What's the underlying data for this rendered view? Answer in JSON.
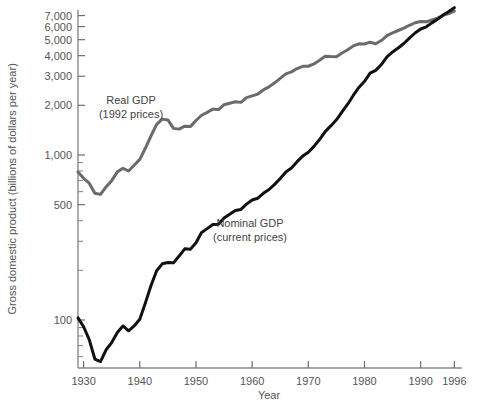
{
  "chart_data": {
    "type": "line",
    "title": "",
    "xlabel": "Year",
    "ylabel": "Gross domestic product (billions of dollars per year)",
    "yscale": "log",
    "ylim": [
      40,
      7600
    ],
    "xlim": [
      1929,
      1997
    ],
    "grid": false,
    "legend_position": "inline-annotation",
    "y_tick_labels": [
      "7,000",
      "6,000",
      "5,000",
      "4,000",
      "3,000",
      "2,000",
      "1,000",
      "500",
      "100"
    ],
    "y_tick_values": [
      7000,
      6000,
      5000,
      4000,
      3000,
      2000,
      1000,
      500,
      100
    ],
    "y_minor_tick_values": [
      900,
      800,
      700,
      600,
      400,
      300,
      200,
      90,
      80,
      70,
      60,
      50
    ],
    "x_tick_labels": [
      "1930",
      "1940",
      "1950",
      "1960",
      "1970",
      "1980",
      "1990",
      "1996"
    ],
    "x_tick_values": [
      1930,
      1940,
      1950,
      1960,
      1970,
      1980,
      1990,
      1996
    ],
    "series": [
      {
        "name": "Real GDP",
        "annotation_line1": "Real GDP",
        "annotation_line2": "(1992 prices)",
        "color": "#6b6b6b",
        "width": 3.0,
        "x": [
          1929,
          1930,
          1931,
          1932,
          1933,
          1934,
          1935,
          1936,
          1937,
          1938,
          1939,
          1940,
          1941,
          1942,
          1943,
          1944,
          1945,
          1946,
          1947,
          1948,
          1949,
          1950,
          1951,
          1952,
          1953,
          1954,
          1955,
          1956,
          1957,
          1958,
          1959,
          1960,
          1961,
          1962,
          1963,
          1964,
          1965,
          1966,
          1967,
          1968,
          1969,
          1970,
          1971,
          1972,
          1973,
          1974,
          1975,
          1976,
          1977,
          1978,
          1979,
          1980,
          1981,
          1982,
          1983,
          1984,
          1985,
          1986,
          1987,
          1988,
          1989,
          1990,
          1991,
          1992,
          1993,
          1994,
          1995,
          1996
        ],
        "y": [
          790,
          722,
          675,
          587,
          577,
          641,
          699,
          790,
          830,
          800,
          866,
          941,
          1102,
          1308,
          1532,
          1650,
          1632,
          1450,
          1435,
          1495,
          1486,
          1618,
          1742,
          1812,
          1897,
          1884,
          2018,
          2061,
          2103,
          2084,
          2226,
          2282,
          2340,
          2480,
          2588,
          2738,
          2913,
          3104,
          3189,
          3341,
          3446,
          3451,
          3565,
          3755,
          3972,
          3952,
          3940,
          4153,
          4346,
          4580,
          4721,
          4709,
          4827,
          4727,
          4939,
          5295,
          5500,
          5682,
          5870,
          6113,
          6332,
          6439,
          6412,
          6575,
          6750,
          7020,
          7190,
          7450
        ]
      },
      {
        "name": "Nominal GDP",
        "annotation_line1": "Nominal GDP",
        "annotation_line2": "(current prices)",
        "color": "#111111",
        "width": 3.0,
        "x": [
          1929,
          1930,
          1931,
          1932,
          1933,
          1934,
          1935,
          1936,
          1937,
          1938,
          1939,
          1940,
          1941,
          1942,
          1943,
          1944,
          1945,
          1946,
          1947,
          1948,
          1949,
          1950,
          1951,
          1952,
          1953,
          1954,
          1955,
          1956,
          1957,
          1958,
          1959,
          1960,
          1961,
          1962,
          1963,
          1964,
          1965,
          1966,
          1967,
          1968,
          1969,
          1970,
          1971,
          1972,
          1973,
          1974,
          1975,
          1976,
          1977,
          1978,
          1979,
          1980,
          1981,
          1982,
          1983,
          1984,
          1985,
          1986,
          1987,
          1988,
          1989,
          1990,
          1991,
          1992,
          1993,
          1994,
          1995,
          1996
        ],
        "y": [
          103,
          91,
          76,
          58,
          56,
          66,
          73,
          84,
          92,
          86,
          92,
          101,
          127,
          162,
          199,
          219,
          223,
          222,
          244,
          270,
          268,
          294,
          339,
          358,
          379,
          381,
          415,
          438,
          461,
          468,
          504,
          534,
          547,
          586,
          618,
          664,
          720,
          789,
          834,
          911,
          985,
          1039,
          1128,
          1241,
          1386,
          1501,
          1635,
          1824,
          2031,
          2295,
          2566,
          2796,
          3131,
          3259,
          3535,
          3933,
          4213,
          4453,
          4742,
          5108,
          5489,
          5803,
          5986,
          6319,
          6642,
          7054,
          7401,
          7813
        ]
      }
    ],
    "annotations": [
      {
        "id": "real-gdp-annotation",
        "line1": "Real GDP",
        "line2": "(1992 prices)",
        "x_px": 131,
        "y_px": 104
      },
      {
        "id": "nominal-gdp-annotation",
        "line1": "Nominal GDP",
        "line2": "(current prices)",
        "x_px": 250,
        "y_px": 227
      }
    ]
  },
  "layout": {
    "plot_left": 78,
    "plot_right": 460,
    "plot_top": 12,
    "plot_bottom": 368,
    "y_label_x": 16,
    "x_label_y": 399
  }
}
